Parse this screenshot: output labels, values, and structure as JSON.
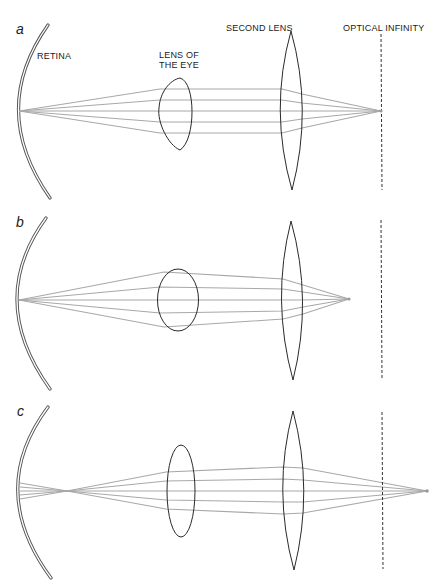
{
  "figure": {
    "labels": {
      "retina": "RETINA",
      "lens_of_eye_line1": "LENS OF",
      "lens_of_eye_line2": "THE EYE",
      "second_lens": "SECOND LENS",
      "optical_infinity": "OPTICAL INFINITY"
    },
    "panels": [
      {
        "id": "a",
        "label": "a",
        "description": "Relaxed eye lens; parallel rays from second lens focus at optical infinity and converge on retina",
        "focus": "at optical infinity"
      },
      {
        "id": "b",
        "label": "b",
        "description": "Accommodated (rounder) eye lens; second lens focal point lies nearer than optical infinity",
        "focus": "inside optical infinity"
      },
      {
        "id": "c",
        "label": "c",
        "description": "Relaxed eye lens with object beyond optical infinity; rays cross in front of retina",
        "focus": "beyond optical infinity"
      }
    ],
    "colors": {
      "ray": "#a8a8a8",
      "lens_outline": "#2a2a2a",
      "retina": "#555555",
      "text": "#222222",
      "background": "#ffffff"
    }
  }
}
